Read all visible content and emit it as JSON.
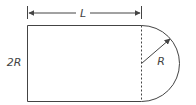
{
  "diagram": {
    "labels": {
      "length": "L",
      "height": "2R",
      "radius": "R"
    },
    "colors": {
      "stroke": "#444444",
      "background": "#ffffff"
    }
  }
}
